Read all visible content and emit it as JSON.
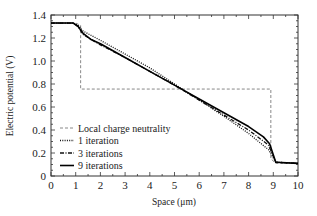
{
  "chart_data": {
    "type": "line",
    "title": "",
    "xlabel": "Space (μm)",
    "ylabel": "Electric potential (V)",
    "xlim": [
      0,
      10
    ],
    "ylim": [
      0,
      1.4
    ],
    "xticks": [
      0,
      1,
      2,
      3,
      4,
      5,
      6,
      7,
      8,
      9,
      10
    ],
    "yticks": [
      0,
      0.2,
      0.4,
      0.6,
      0.8,
      1.0,
      1.2,
      1.4
    ],
    "ytick_labels": [
      "0",
      "0.2",
      "0.4",
      "0.6",
      "0.8",
      "1.0",
      "1.2",
      "1.4"
    ],
    "grid": false,
    "legend_position": "lower left (inside)",
    "series": [
      {
        "name": "Local charge neutrality",
        "style": "dashed",
        "color": "#888888",
        "x": [
          0,
          1.0,
          1.2,
          1.2,
          8.9,
          8.9,
          9.1,
          10
        ],
        "y": [
          1.33,
          1.33,
          1.31,
          0.756,
          0.756,
          0.15,
          0.11,
          0.11
        ]
      },
      {
        "name": "1 iteration",
        "style": "dotted",
        "color": "#111111",
        "x": [
          0,
          0.9,
          1.1,
          1.3,
          2,
          3,
          4,
          5,
          6,
          7,
          8,
          8.8,
          9.1,
          10
        ],
        "y": [
          1.33,
          1.33,
          1.31,
          1.26,
          1.18,
          1.06,
          0.94,
          0.8,
          0.66,
          0.52,
          0.37,
          0.23,
          0.12,
          0.11
        ]
      },
      {
        "name": "3 iterations",
        "style": "dash-dot",
        "color": "#111111",
        "x": [
          0,
          0.9,
          1.1,
          1.3,
          2,
          3,
          4,
          5,
          6,
          7,
          8,
          8.8,
          9.1,
          10
        ],
        "y": [
          1.33,
          1.33,
          1.3,
          1.23,
          1.14,
          1.03,
          0.91,
          0.79,
          0.66,
          0.53,
          0.4,
          0.27,
          0.12,
          0.11
        ]
      },
      {
        "name": "9 iterations",
        "style": "solid",
        "color": "#000000",
        "x": [
          0,
          0.9,
          1.1,
          1.3,
          1.6,
          2,
          3,
          4,
          5,
          6,
          7,
          8,
          8.6,
          8.85,
          9.1,
          10
        ],
        "y": [
          1.33,
          1.33,
          1.3,
          1.24,
          1.19,
          1.15,
          1.03,
          0.91,
          0.79,
          0.67,
          0.55,
          0.43,
          0.34,
          0.28,
          0.12,
          0.11
        ]
      }
    ]
  }
}
